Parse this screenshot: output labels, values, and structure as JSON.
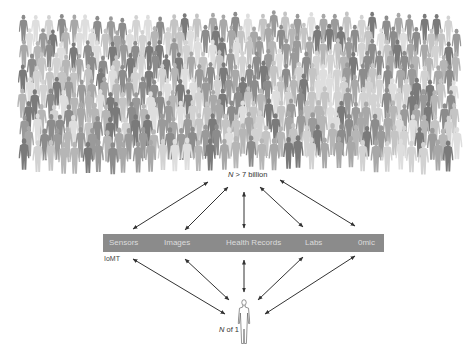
{
  "population": {
    "label_prefix": "N",
    "label_rest": " > 7 billion",
    "figure_shades": [
      "#7a7a7a",
      "#8c8c8c",
      "#9a9a9a",
      "#a8a8a8",
      "#b6b6b6",
      "#c4c4c4",
      "#d2d2d2",
      "#dedede"
    ]
  },
  "data_bar": {
    "color": "#8b8b8b",
    "text_color": "#dcdcdc",
    "items": [
      {
        "label": "Sensors",
        "x": 6
      },
      {
        "label": "Images",
        "x": 61
      },
      {
        "label": "Health Records",
        "x": 123
      },
      {
        "label": "Labs",
        "x": 202
      },
      {
        "label": "0mic",
        "x": 255
      }
    ],
    "sub_label": "IoMT"
  },
  "individual": {
    "label_prefix": "N",
    "label_rest": " of 1"
  },
  "arrows": {
    "upper": [
      {
        "x1": 133,
        "y1": 229,
        "x2": 208,
        "y2": 182
      },
      {
        "x1": 185,
        "y1": 230,
        "x2": 228,
        "y2": 187
      },
      {
        "x1": 244,
        "y1": 192,
        "x2": 244,
        "y2": 228
      },
      {
        "x1": 260,
        "y1": 187,
        "x2": 303,
        "y2": 227
      },
      {
        "x1": 280,
        "y1": 180,
        "x2": 355,
        "y2": 226
      }
    ],
    "lower": [
      {
        "x1": 133,
        "y1": 259,
        "x2": 225,
        "y2": 314
      },
      {
        "x1": 185,
        "y1": 259,
        "x2": 229,
        "y2": 300
      },
      {
        "x1": 244,
        "y1": 260,
        "x2": 244,
        "y2": 292
      },
      {
        "x1": 303,
        "y1": 257,
        "x2": 258,
        "y2": 300
      },
      {
        "x1": 355,
        "y1": 256,
        "x2": 265,
        "y2": 314
      }
    ]
  }
}
